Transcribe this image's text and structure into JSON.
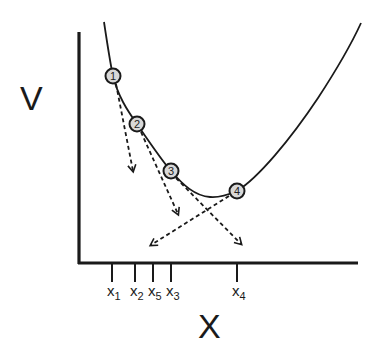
{
  "diagram": {
    "y_axis_label": "V",
    "x_axis_label": "X",
    "colors": {
      "line": "#1a1a1a",
      "point_fill": "#d8d8d8",
      "background": "#ffffff"
    },
    "curve": "convex potential curve V(x) with a single minimum",
    "points": [
      {
        "label": "1",
        "cx": 113,
        "cy": 76
      },
      {
        "label": "2",
        "cx": 137,
        "cy": 124
      },
      {
        "label": "3",
        "cx": 171,
        "cy": 171
      },
      {
        "label": "4",
        "cx": 237,
        "cy": 191
      }
    ],
    "arrows": [
      {
        "from": "1",
        "style": "dashed",
        "direction": "down-right (gradient step)"
      },
      {
        "from": "2",
        "style": "dashed",
        "direction": "down-right (gradient step)"
      },
      {
        "from": "3",
        "style": "dashed",
        "direction": "down-right (gradient step)"
      },
      {
        "from": "4",
        "style": "dashed",
        "direction": "down-left (gradient step)"
      }
    ],
    "ticks": [
      {
        "base": "x",
        "sub": "1",
        "x": 112
      },
      {
        "base": "x",
        "sub": "2",
        "x": 135
      },
      {
        "base": "x",
        "sub": "5",
        "x": 153
      },
      {
        "base": "x",
        "sub": "3",
        "x": 171
      },
      {
        "base": "x",
        "sub": "4",
        "x": 237
      }
    ]
  }
}
